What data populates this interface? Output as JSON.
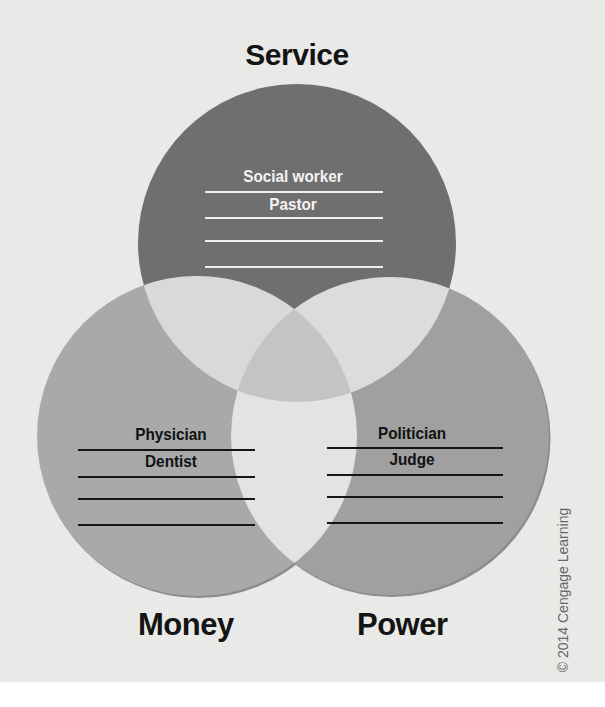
{
  "diagram": {
    "type": "venn",
    "background_color": "#e9e9e8",
    "sets": [
      {
        "id": "service",
        "label": "Service",
        "fill": "#6f6f6f",
        "cx": 297,
        "cy": 243,
        "r": 159,
        "examples": [
          "Social worker",
          "Pastor",
          "",
          ""
        ],
        "example_text_color": "#f4f4f4",
        "line_color": "#f0f0f0",
        "lines": {
          "x1": 205,
          "x2": 383,
          "ys": [
            192,
            218,
            241,
            267
          ]
        }
      },
      {
        "id": "money",
        "label": "Money",
        "fill": "#a9a9a9",
        "cx": 197,
        "cy": 436,
        "r": 160,
        "examples": [
          "Physician",
          "Dentist",
          "",
          ""
        ],
        "example_text_color": "#111111",
        "line_color": "#151515",
        "lines": {
          "x1": 78,
          "x2": 255,
          "ys": [
            450,
            477,
            499,
            525
          ]
        }
      },
      {
        "id": "power",
        "label": "Power",
        "fill": "#a0a0a0",
        "cx": 390,
        "cy": 436,
        "r": 159,
        "examples": [
          "Politician",
          "Judge",
          "",
          ""
        ],
        "example_text_color": "#111111",
        "line_color": "#151515",
        "lines": {
          "x1": 327,
          "x2": 503,
          "ys": [
            448,
            475,
            497,
            523
          ]
        }
      }
    ],
    "overlap_colors": {
      "service_money": "#d9d9d8",
      "service_power": "#dcdcdb",
      "money_power": "#e3e3e2",
      "all_three": "#c4c4c3"
    }
  },
  "labels": {
    "service": "Service",
    "money": "Money",
    "power": "Power",
    "social_worker": "Social worker",
    "pastor": "Pastor",
    "physician": "Physician",
    "dentist": "Dentist",
    "politician": "Politician",
    "judge": "Judge"
  },
  "copyright": "© 2014 Cengage Learning"
}
